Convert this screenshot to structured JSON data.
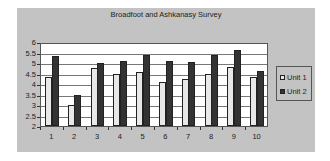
{
  "chart_data": {
    "type": "bar",
    "title": "Broadfoot and Ashkanasy Survey",
    "xlabel": "",
    "ylabel": "",
    "categories": [
      "1",
      "2",
      "3",
      "4",
      "5",
      "6",
      "7",
      "8",
      "9",
      "10"
    ],
    "series": [
      {
        "name": "Unit 1",
        "color": "#e8e8e8",
        "values": [
          4.35,
          3.0,
          4.75,
          4.5,
          4.55,
          4.1,
          4.25,
          4.5,
          4.8,
          4.35
        ]
      },
      {
        "name": "Unit 2",
        "color": "#333333",
        "values": [
          5.33,
          3.5,
          5.0,
          5.08,
          5.37,
          5.1,
          5.05,
          5.37,
          5.6,
          4.6
        ]
      }
    ],
    "ylim": [
      2,
      6
    ],
    "yticks": [
      "2",
      "2.5",
      "3",
      "3.5",
      "4",
      "4.5",
      "5",
      "5.5",
      "6"
    ],
    "grid": true,
    "legend_position": "right"
  },
  "colors": {
    "chart_background": "#c3c3c3",
    "plot_background": "#ffffff"
  }
}
